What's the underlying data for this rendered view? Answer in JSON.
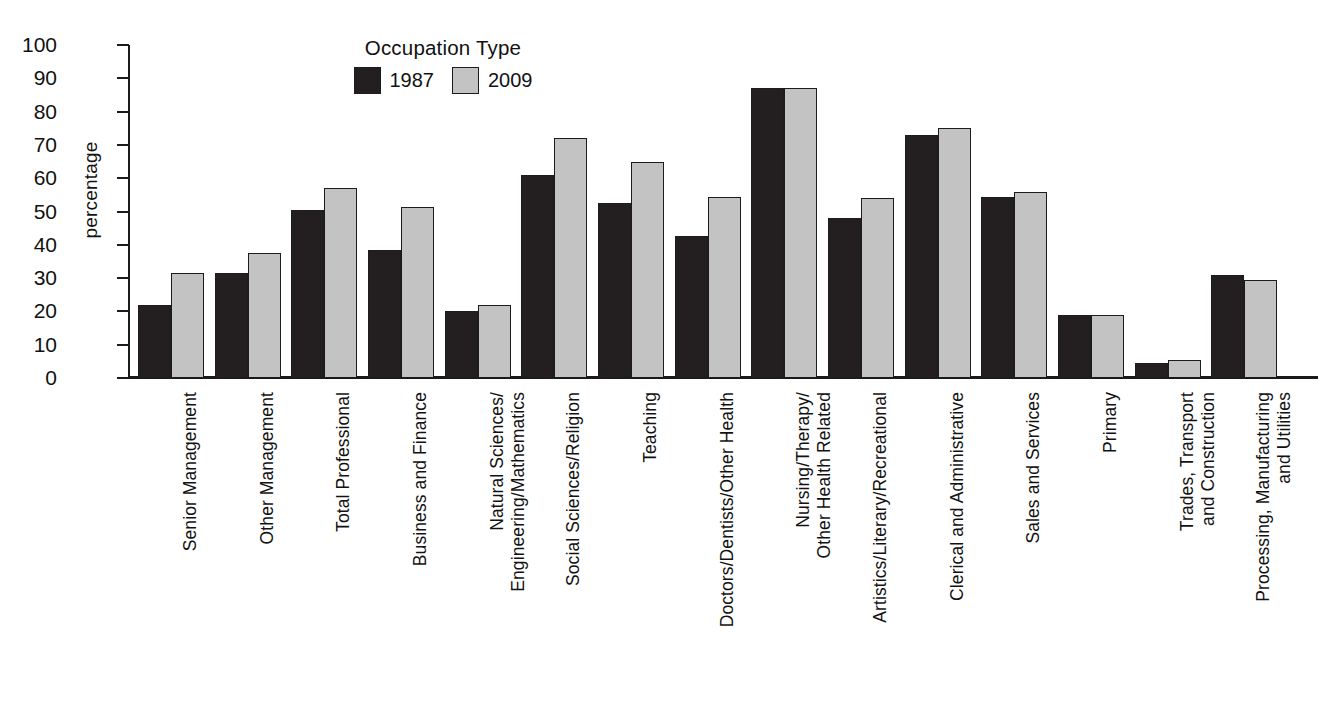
{
  "chart_data": {
    "type": "bar",
    "title": "",
    "xlabel": "",
    "ylabel": "percentage",
    "ylim": [
      0,
      100
    ],
    "yticks": [
      100,
      90,
      80,
      70,
      60,
      50,
      40,
      30,
      20,
      10,
      0
    ],
    "grid": false,
    "legend": {
      "title": "Occupation Type",
      "position": "top-left-inside",
      "entries": [
        {
          "name": "1987",
          "color": "#231f20"
        },
        {
          "name": "2009",
          "color": "#c3c3c3"
        }
      ]
    },
    "categories": [
      "Senior Management",
      "Other Management",
      "Total Professional",
      "Business and Finance",
      "Natural Sciences/\nEngineering/Mathematics",
      "Social Sciences/Religion",
      "Teaching",
      "Doctors/Dentists/Other Health",
      "Nursing/Therapy/\nOther Health Related",
      "Artistics/Literary/Recreational",
      "Clerical and Administrative",
      "Sales and Services",
      "Primary",
      "Trades, Transport\nand Construction",
      "Processing, Manufacturing\nand Utilities"
    ],
    "series": [
      {
        "name": "1987",
        "color": "#231f20",
        "values": [
          22,
          31.5,
          50.5,
          38.5,
          20,
          61,
          52.5,
          42.5,
          87,
          48,
          73,
          54.5,
          19,
          4.5,
          31
        ]
      },
      {
        "name": "2009",
        "color": "#c3c3c3",
        "values": [
          31.5,
          37.5,
          57,
          51.5,
          22,
          72,
          65,
          54.5,
          87,
          54,
          75,
          56,
          19,
          5.5,
          29.5
        ]
      }
    ]
  },
  "colors": {
    "series_1987": "#231f20",
    "series_2009": "#c3c3c3",
    "axis": "#1a1a1a",
    "background": "#ffffff",
    "text": "#111111"
  }
}
